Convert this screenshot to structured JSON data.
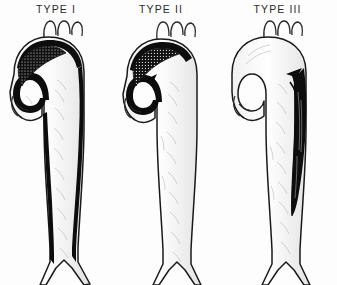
{
  "figure": {
    "title_visible": false,
    "background_color": "#fdfdfd",
    "ink_color": "#111111",
    "label_color": "#2b2b2b",
    "shading_color": "#8d8d8d",
    "panel_count": 3
  },
  "panels": [
    {
      "id": "type-1",
      "label": "TYPE I",
      "dissection_extent": "ascending aorta through arch and entire descending aorta to iliac bifurcation",
      "entry_tear_location": "ascending aorta",
      "entry_tear_marker": "stippled-tear",
      "false_lumen_shading": "black",
      "false_lumen_walls": "bilateral",
      "arch_vessel_count": 3,
      "bifurcation_visible": true
    },
    {
      "id": "type-2",
      "label": "TYPE II",
      "dissection_extent": "confined to ascending aorta",
      "entry_tear_location": "ascending aorta",
      "entry_tear_marker": "arrow",
      "false_lumen_shading": "black",
      "false_lumen_walls": "ascending-only",
      "arch_vessel_count": 3,
      "bifurcation_visible": true
    },
    {
      "id": "type-3",
      "label": "TYPE III",
      "dissection_extent": "descending aorta distal to left subclavian artery",
      "entry_tear_location": "descending aorta distal to left subclavian artery",
      "entry_tear_marker": "arrow",
      "false_lumen_shading": "black",
      "false_lumen_walls": "posterolateral",
      "arch_vessel_count": 3,
      "bifurcation_visible": true
    }
  ]
}
